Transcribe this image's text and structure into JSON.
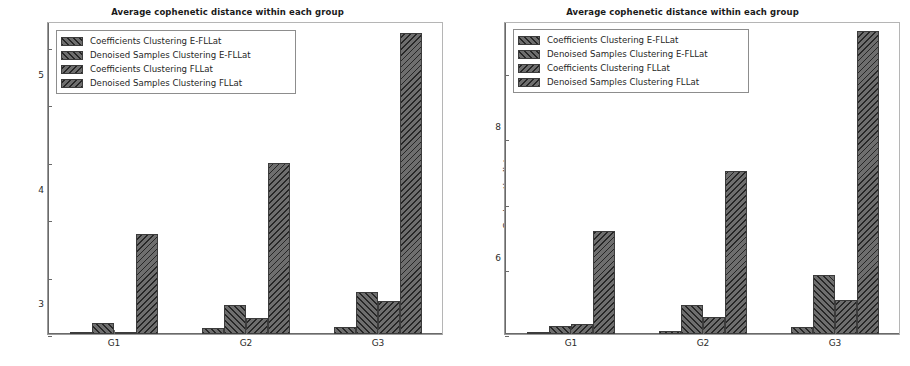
{
  "figure": {
    "panels": [
      "left",
      "right"
    ]
  },
  "chart_data": [
    {
      "panel": "left",
      "type": "bar",
      "title": "Average cophenetic distance within each group",
      "xlabel": "",
      "ylabel": "Cophenetic distance",
      "categories": [
        "G1",
        "G2",
        "G3"
      ],
      "xticklabels": [
        "G1",
        "G2",
        "G3"
      ],
      "yticks": [
        0,
        1,
        2,
        3,
        4,
        5
      ],
      "yticklabels": [
        "0",
        "1",
        "2",
        "3",
        "4",
        "5"
      ],
      "ylim": [
        0,
        5.45
      ],
      "grid": false,
      "legend_position": "upper left",
      "series": [
        {
          "name": "Coefficients Clustering  E-FLLat",
          "hatch": "///",
          "values": [
            0.02,
            0.1,
            0.13
          ]
        },
        {
          "name": "Denoised Samples Clustering E-FLLat",
          "hatch": "///",
          "values": [
            0.2,
            0.5,
            0.73
          ]
        },
        {
          "name": "Coefficients Clustering FLLat",
          "hatch": "\\\\",
          "values": [
            0.01,
            0.28,
            0.57
          ]
        },
        {
          "name": "Denoised Samples Clustering FLLat",
          "hatch": "\\\\",
          "values": [
            1.75,
            2.98,
            5.25
          ]
        }
      ]
    },
    {
      "panel": "right",
      "type": "bar",
      "title": "Average cophenetic distance within each group",
      "xlabel": "",
      "ylabel": "Cophenetic distance",
      "categories": [
        "G1",
        "G2",
        "G3"
      ],
      "xticklabels": [
        "G1",
        "G2",
        "G3"
      ],
      "yticks": [
        0,
        2,
        4,
        6,
        8
      ],
      "yticklabels": [
        "0",
        "2",
        "4",
        "6",
        "8"
      ],
      "ylim": [
        0,
        9.6
      ],
      "grid": false,
      "legend_position": "upper left",
      "series": [
        {
          "name": "Coefficients Clustering  E-FLLat",
          "hatch": "///",
          "values": [
            0.03,
            0.08,
            0.22
          ]
        },
        {
          "name": "Denoised Samples Clustering E-FLLat",
          "hatch": "///",
          "values": [
            0.25,
            0.88,
            1.8
          ]
        },
        {
          "name": "Coefficients Clustering FLLat",
          "hatch": "\\\\",
          "values": [
            0.32,
            0.52,
            1.05
          ]
        },
        {
          "name": "Denoised Samples Clustering FLLat",
          "hatch": "\\\\",
          "values": [
            3.15,
            5.0,
            9.3
          ]
        }
      ]
    }
  ]
}
